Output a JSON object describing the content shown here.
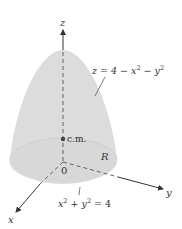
{
  "figure": {
    "colors": {
      "solid_fill": "#dcdcdc",
      "solid_shade": "#cfcfcf",
      "axis": "#333333",
      "text": "#333333"
    },
    "labels": {
      "z_axis": "z",
      "y_axis": "y",
      "x_axis": "x",
      "origin": "0",
      "center_of_mass": "c.m.",
      "region": "R"
    },
    "equations": {
      "surface": {
        "lhs": "z = 4 − x",
        "exp1": "2",
        "mid": " − y",
        "exp2": "2"
      },
      "boundary": {
        "x": "x",
        "exp1": "2",
        "mid": " + y",
        "exp2": "2",
        "rhs": " = 4"
      }
    }
  }
}
